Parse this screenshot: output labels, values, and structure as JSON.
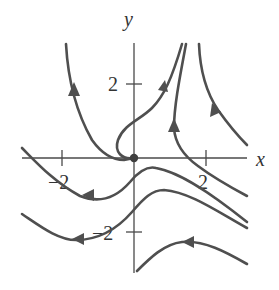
{
  "diagram": {
    "type": "phase-portrait",
    "axes": {
      "x_label": "x",
      "y_label": "y",
      "x_ticks": [
        {
          "value": -2,
          "label": "−2"
        },
        {
          "value": 2,
          "label": "2"
        }
      ],
      "y_ticks": [
        {
          "value": 2,
          "label": "2"
        },
        {
          "value": -2,
          "label": "−2"
        }
      ]
    },
    "equilibrium": {
      "x": 0,
      "y": 0,
      "label": ""
    },
    "colors": {
      "curve": "#4f4f4f",
      "axis": "#4a4a4a",
      "text": "#333333",
      "background": "#ffffff"
    },
    "trajectories": [
      {
        "id": "upper-left-branch",
        "direction": "up"
      },
      {
        "id": "loop-from-origin",
        "direction": "up-right"
      },
      {
        "id": "upper-middle-branch",
        "direction": "up"
      },
      {
        "id": "upper-right-branch",
        "direction": "up-left"
      },
      {
        "id": "middle-curve-1",
        "direction": "left"
      },
      {
        "id": "middle-curve-2",
        "direction": "left"
      },
      {
        "id": "lower-curve",
        "direction": "left"
      },
      {
        "id": "upper-right-straight",
        "direction": "down-right"
      }
    ]
  }
}
